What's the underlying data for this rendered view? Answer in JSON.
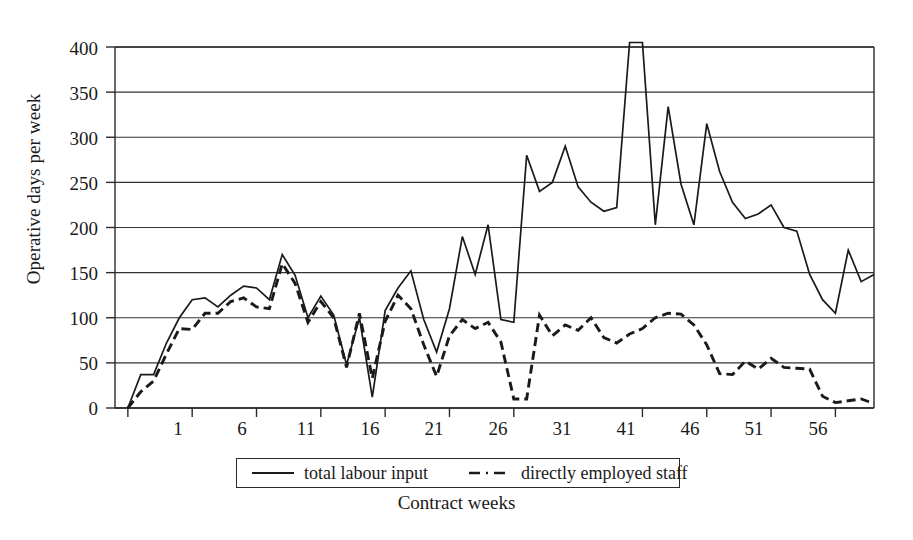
{
  "chart_data": {
    "type": "line",
    "title": "",
    "xlabel": "Contract weeks",
    "ylabel": "Operative days per week",
    "xlim": [
      0,
      59
    ],
    "ylim": [
      0,
      400
    ],
    "yticks": [
      0,
      50,
      100,
      150,
      200,
      250,
      300,
      350,
      400
    ],
    "xticks": [
      1,
      6,
      11,
      16,
      21,
      26,
      31,
      41,
      46,
      51,
      56
    ],
    "grid": "horizontal",
    "legend_position": "below-axes",
    "x": [
      1,
      2,
      3,
      4,
      5,
      6,
      7,
      8,
      9,
      10,
      11,
      12,
      13,
      14,
      15,
      16,
      17,
      18,
      19,
      20,
      21,
      22,
      23,
      24,
      25,
      26,
      27,
      28,
      29,
      30,
      31,
      32,
      33,
      34,
      35,
      36,
      37,
      38,
      39,
      40,
      41,
      42,
      43,
      44,
      45,
      46,
      47,
      48,
      49,
      50,
      51,
      52,
      53,
      54,
      55,
      56,
      57,
      58,
      59
    ],
    "series": [
      {
        "name": "total labour input",
        "style": "solid",
        "color": "#1a1a1a",
        "values": [
          0,
          37,
          37,
          72,
          100,
          120,
          122,
          112,
          125,
          135,
          133,
          120,
          170,
          147,
          100,
          124,
          103,
          48,
          100,
          12,
          108,
          133,
          152,
          98,
          62,
          110,
          190,
          148,
          203,
          98,
          95,
          280,
          240,
          250,
          290,
          245,
          228,
          218,
          222,
          405,
          405,
          203,
          334,
          248,
          203,
          315,
          262,
          228,
          210,
          215,
          225,
          200,
          196,
          148,
          120,
          105,
          175,
          140,
          148
        ]
      },
      {
        "name": "directly employed staff",
        "style": "dashed",
        "color": "#1a1a1a",
        "values": [
          0,
          18,
          30,
          60,
          88,
          87,
          105,
          105,
          118,
          122,
          112,
          110,
          160,
          138,
          95,
          118,
          100,
          45,
          105,
          33,
          96,
          125,
          110,
          70,
          35,
          80,
          98,
          88,
          95,
          73,
          10,
          10,
          103,
          80,
          92,
          86,
          100,
          78,
          72,
          82,
          88,
          100,
          105,
          104,
          92,
          70,
          38,
          37,
          52,
          43,
          55,
          45,
          44,
          43,
          13,
          6,
          8,
          10,
          5
        ]
      }
    ]
  },
  "axis": {
    "ylabel": "Operative days per week",
    "xlabel": "Contract weeks",
    "ytick_labels": [
      "400",
      "350",
      "300",
      "250",
      "200",
      "150",
      "100",
      "50",
      "0"
    ],
    "xtick_labels": [
      "1",
      "6",
      "11",
      "16",
      "21",
      "26",
      "31",
      "41",
      "46",
      "51",
      "56"
    ]
  },
  "legend": {
    "items": [
      {
        "label": "total labour input",
        "style": "solid"
      },
      {
        "label": "directly employed staff",
        "style": "dashed"
      }
    ]
  },
  "colors": {
    "line": "#1a1a1a",
    "grid": "#333333",
    "frame": "#2a2a2a",
    "background": "#ffffff"
  }
}
